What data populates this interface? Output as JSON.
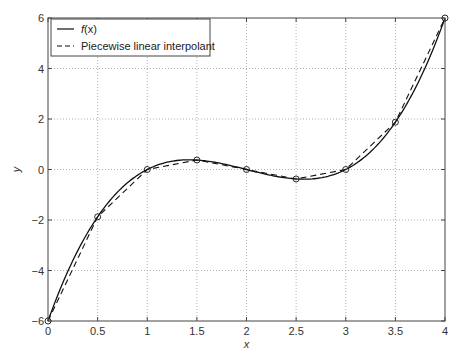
{
  "chart_data": {
    "type": "line",
    "title": "",
    "xlabel": "x",
    "ylabel": "y",
    "xlim": [
      0,
      4
    ],
    "ylim": [
      -6,
      6
    ],
    "grid": true,
    "legend_position": "upper left",
    "x_ticks": [
      0,
      0.5,
      1,
      1.5,
      2,
      2.5,
      3,
      3.5,
      4
    ],
    "x_tick_labels": [
      "0",
      "0.5",
      "1",
      "1.5",
      "2",
      "2.5",
      "3",
      "3.5",
      "4"
    ],
    "y_ticks": [
      -6,
      -4,
      -2,
      0,
      2,
      4,
      6
    ],
    "y_tick_labels": [
      "−6",
      "−4",
      "−2",
      "0",
      "2",
      "4",
      "6"
    ],
    "series": [
      {
        "name": "f(x)",
        "legend_label_prefix": "f",
        "legend_label_suffix": "(x)",
        "style": "solid",
        "expression": "(x-1)(x-2)(x-3)",
        "x": [
          0,
          0.25,
          0.5,
          0.75,
          1,
          1.25,
          1.5,
          1.75,
          2,
          2.25,
          2.5,
          2.75,
          3,
          3.25,
          3.5,
          3.75,
          4
        ],
        "values": [
          -6,
          -3.281,
          -1.875,
          -0.703,
          0,
          0.328,
          0.375,
          0.234,
          0,
          -0.234,
          -0.375,
          -0.328,
          0,
          0.703,
          1.875,
          3.281,
          6
        ]
      },
      {
        "name": "Piecewise linear interpolant",
        "style": "dashed",
        "markers": "circle",
        "x": [
          0,
          0.5,
          1,
          1.5,
          2,
          2.5,
          3,
          3.5,
          4
        ],
        "values": [
          -6,
          -1.875,
          0,
          0.375,
          0,
          -0.375,
          0,
          1.875,
          6
        ]
      }
    ]
  },
  "colors": {
    "line": "#111111",
    "grid": "#9a9a9a",
    "axes": "#444444",
    "background": "#ffffff"
  }
}
